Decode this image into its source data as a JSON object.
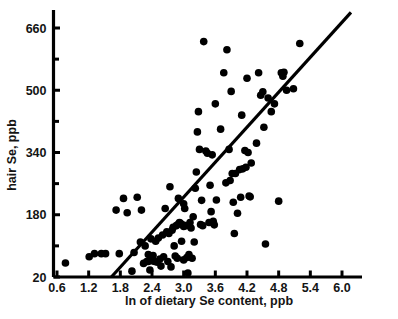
{
  "chart_data": {
    "type": "scatter",
    "title": "",
    "xlabel": "ln of dietary Se content, ppb",
    "ylabel": "hair Se, ppb",
    "xlim": [
      0.45,
      6.3
    ],
    "ylim": [
      20,
      700
    ],
    "grid": false,
    "legend": null,
    "xticks": [
      0.6,
      1.2,
      1.8,
      2.4,
      3.0,
      3.6,
      4.2,
      4.8,
      5.4,
      6.0
    ],
    "xtick_labels": [
      "0.6",
      "1.2",
      "1.8",
      "2.4",
      "3.0",
      "3.6",
      "4.2",
      "4.8",
      "5.4",
      "6.0"
    ],
    "yticks": [
      20,
      180,
      340,
      500,
      660
    ],
    "ytick_labels": [
      "20",
      "180",
      "340",
      "500",
      "660"
    ],
    "yticks_minor": [
      100,
      260,
      420,
      580
    ],
    "marker": {
      "shape": "circle",
      "color": "#000000",
      "size": 5.4
    },
    "fit_line": {
      "label": "regression line",
      "color": "#000000",
      "width": 3.2,
      "x_start": 1.63,
      "y_start": 20,
      "x_end": 6.17,
      "y_end": 700
    },
    "points": [
      [
        0.76,
        56
      ],
      [
        1.21,
        72
      ],
      [
        1.31,
        80
      ],
      [
        1.44,
        80
      ],
      [
        1.52,
        80
      ],
      [
        1.72,
        192
      ],
      [
        1.78,
        80
      ],
      [
        1.86,
        222
      ],
      [
        1.93,
        185
      ],
      [
        2.02,
        35
      ],
      [
        2.06,
        83
      ],
      [
        2.12,
        225
      ],
      [
        2.18,
        110
      ],
      [
        2.2,
        192
      ],
      [
        2.24,
        55
      ],
      [
        2.27,
        100
      ],
      [
        2.3,
        60
      ],
      [
        2.33,
        78
      ],
      [
        2.33,
        60
      ],
      [
        2.36,
        38
      ],
      [
        2.38,
        118
      ],
      [
        2.4,
        62
      ],
      [
        2.42,
        75
      ],
      [
        2.45,
        60
      ],
      [
        2.47,
        112
      ],
      [
        2.5,
        58
      ],
      [
        2.52,
        120
      ],
      [
        2.55,
        66
      ],
      [
        2.57,
        48
      ],
      [
        2.6,
        128
      ],
      [
        2.62,
        72
      ],
      [
        2.65,
        196
      ],
      [
        2.68,
        136
      ],
      [
        2.7,
        60
      ],
      [
        2.72,
        132
      ],
      [
        2.74,
        252
      ],
      [
        2.76,
        46
      ],
      [
        2.78,
        140
      ],
      [
        2.8,
        148
      ],
      [
        2.82,
        100
      ],
      [
        2.84,
        74
      ],
      [
        2.86,
        152
      ],
      [
        2.88,
        68
      ],
      [
        2.9,
        222
      ],
      [
        2.9,
        156
      ],
      [
        2.92,
        160
      ],
      [
        2.94,
        158
      ],
      [
        2.96,
        112
      ],
      [
        2.98,
        154
      ],
      [
        3.0,
        208
      ],
      [
        3.0,
        150
      ],
      [
        3.0,
        64
      ],
      [
        3.02,
        196
      ],
      [
        3.04,
        152
      ],
      [
        3.06,
        70
      ],
      [
        3.08,
        30
      ],
      [
        3.1,
        78
      ],
      [
        3.12,
        160
      ],
      [
        3.14,
        146
      ],
      [
        3.16,
        68
      ],
      [
        3.18,
        175
      ],
      [
        3.2,
        110
      ],
      [
        3.22,
        248
      ],
      [
        3.24,
        290
      ],
      [
        3.26,
        393
      ],
      [
        3.28,
        445
      ],
      [
        3.3,
        348
      ],
      [
        3.32,
        155
      ],
      [
        3.34,
        217
      ],
      [
        3.36,
        152
      ],
      [
        3.38,
        625
      ],
      [
        3.42,
        344
      ],
      [
        3.45,
        338
      ],
      [
        3.48,
        160
      ],
      [
        3.5,
        256
      ],
      [
        3.52,
        188
      ],
      [
        3.54,
        334
      ],
      [
        3.56,
        163
      ],
      [
        3.58,
        154
      ],
      [
        3.6,
        465
      ],
      [
        3.62,
        218
      ],
      [
        3.7,
        400
      ],
      [
        3.76,
        545
      ],
      [
        3.8,
        262
      ],
      [
        3.82,
        604
      ],
      [
        3.86,
        348
      ],
      [
        3.88,
        268
      ],
      [
        3.9,
        497
      ],
      [
        3.92,
        286
      ],
      [
        3.94,
        212
      ],
      [
        3.96,
        132
      ],
      [
        3.98,
        286
      ],
      [
        4.02,
        184
      ],
      [
        4.06,
        296
      ],
      [
        4.08,
        225
      ],
      [
        4.1,
        436
      ],
      [
        4.12,
        298
      ],
      [
        4.16,
        345
      ],
      [
        4.18,
        302
      ],
      [
        4.2,
        531
      ],
      [
        4.22,
        340
      ],
      [
        4.24,
        228
      ],
      [
        4.26,
        226
      ],
      [
        4.28,
        313
      ],
      [
        4.38,
        364
      ],
      [
        4.42,
        545
      ],
      [
        4.46,
        487
      ],
      [
        4.5,
        496
      ],
      [
        4.52,
        405
      ],
      [
        4.55,
        105
      ],
      [
        4.6,
        480
      ],
      [
        4.66,
        445
      ],
      [
        4.72,
        465
      ],
      [
        4.8,
        215
      ],
      [
        4.85,
        545
      ],
      [
        4.88,
        536
      ],
      [
        4.9,
        546
      ],
      [
        4.95,
        500
      ],
      [
        5.08,
        504
      ],
      [
        5.2,
        620
      ]
    ]
  },
  "axis": {
    "x_title": "ln of dietary Se content, ppb",
    "y_title": "hair Se, ppb"
  }
}
